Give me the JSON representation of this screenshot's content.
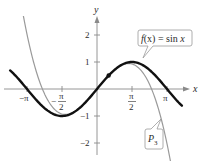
{
  "chart_data": {
    "type": "line",
    "title": "",
    "xlabel": "x",
    "ylabel": "y",
    "xlim": [
      -3.9,
      3.85
    ],
    "ylim": [
      -2.4,
      2.6
    ],
    "grid": false,
    "x_ticks": [
      {
        "value": -3.14159,
        "label_num": "−π",
        "label_den": ""
      },
      {
        "value": -1.5708,
        "label_num": "− π",
        "label_den": "2"
      },
      {
        "value": 1.5708,
        "label_num": "π",
        "label_den": "2"
      },
      {
        "value": 3.14159,
        "label_num": "π",
        "label_den": ""
      }
    ],
    "y_ticks": [
      {
        "value": 2,
        "label": "2"
      },
      {
        "value": 1,
        "label": "1"
      },
      {
        "value": -1,
        "label": "−1"
      },
      {
        "value": -2,
        "label": "−2"
      }
    ],
    "series": [
      {
        "name": "f(x) = sin x",
        "expression": "sin(x)",
        "color": "#111111",
        "width": 2.4,
        "x_range": [
          -3.9,
          3.81
        ]
      },
      {
        "name": "P3",
        "expression": "x - x^3/6",
        "color": "#9a9a9a",
        "width": 1.2,
        "x_range": [
          -3.45,
          3.4
        ]
      }
    ],
    "marked_point": {
      "x": 0.5236,
      "y": 0.5,
      "label": ""
    },
    "annotations": [
      {
        "text_parts": [
          "f",
          "(x) = sin ",
          "x"
        ],
        "target_series": "f(x) = sin x"
      },
      {
        "text_parts": [
          "P",
          "3"
        ],
        "target_series": "P3"
      }
    ]
  },
  "labels": {
    "x_axis": "x",
    "y_axis": "y",
    "callout_sin_f": "f",
    "callout_sin_mid": "(x) = sin ",
    "callout_sin_x": "x",
    "callout_p3_P": "P",
    "callout_p3_sub": "3",
    "xtick_neg_pi": "−π",
    "xtick_neg_half_pi_num": "π",
    "xtick_neg_half_pi_sign": "−",
    "xtick_neg_half_pi_den": "2",
    "xtick_half_pi_num": "π",
    "xtick_half_pi_den": "2",
    "xtick_pi": "π",
    "ytick_2": "2",
    "ytick_1": "1",
    "ytick_neg1": "−1",
    "ytick_neg2": "−2"
  }
}
